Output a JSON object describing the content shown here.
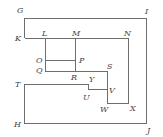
{
  "diagram": {
    "type": "maze-like nested rectangles with labeled points",
    "labels": {
      "G": "G",
      "I": "I",
      "K": "K",
      "L": "L",
      "M": "M",
      "N": "N",
      "O": "O",
      "P": "P",
      "Q": "Q",
      "R": "R",
      "S": "S",
      "T": "T",
      "Y": "Y",
      "U": "U",
      "V": "V",
      "W": "W",
      "X": "X",
      "H": "H",
      "J": "J"
    }
  }
}
